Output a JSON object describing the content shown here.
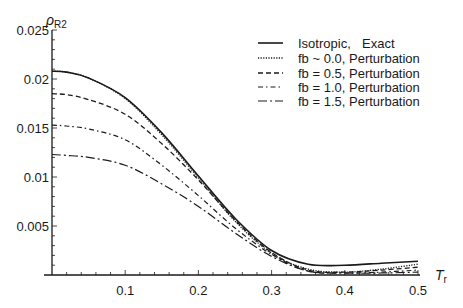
{
  "chart_data": {
    "type": "line",
    "title": "",
    "xlabel": "T",
    "xlabel_sub": "r",
    "ylabel": "ρ",
    "ylabel_sub": "R2",
    "xlim": [
      0,
      0.5
    ],
    "ylim": [
      0,
      0.025
    ],
    "grid": false,
    "legend_position": "upper right",
    "x_ticks": [
      0.1,
      0.2,
      0.3,
      0.4,
      0.5
    ],
    "x_tick_labels": [
      "0.1",
      "0.2",
      "0.3",
      "0.4",
      "0.5"
    ],
    "y_ticks": [
      0.005,
      0.01,
      0.015,
      0.02,
      0.025
    ],
    "y_tick_labels": [
      "0.005",
      "0.01",
      "0.015",
      "0.02",
      "0.025"
    ],
    "x": [
      0.0,
      0.02,
      0.05,
      0.1,
      0.15,
      0.2,
      0.25,
      0.3,
      0.35,
      0.4,
      0.45,
      0.5
    ],
    "series": [
      {
        "name": "Isotropic, Exact",
        "label_a": "Isotropic,",
        "label_b": "Exact",
        "style": "solid",
        "values": [
          0.0208,
          0.0207,
          0.0201,
          0.0181,
          0.0145,
          0.0101,
          0.0058,
          0.0025,
          0.0011,
          0.001,
          0.0012,
          0.0014
        ]
      },
      {
        "name": "fb ~ 0.0, Perturbation",
        "label_a": "fb ~ 0.0,",
        "label_b": "Perturbation",
        "style": "dotted",
        "values": [
          0.0208,
          0.0207,
          0.0201,
          0.018,
          0.0143,
          0.0099,
          0.0055,
          0.0022,
          0.0006,
          0.0003,
          0.0006,
          0.0011
        ]
      },
      {
        "name": "fb = 0.5, Perturbation",
        "label_a": "fb = 0.5,",
        "label_b": "Perturbation",
        "style": "dashed",
        "values": [
          0.0185,
          0.0184,
          0.0179,
          0.0164,
          0.0134,
          0.0097,
          0.0056,
          0.0023,
          0.0005,
          0.0003,
          0.0005,
          0.0008
        ]
      },
      {
        "name": "fb = 1.0, Perturbation",
        "label_a": "fb = 1.0,",
        "label_b": "Perturbation",
        "style": "dashdot",
        "values": [
          0.0153,
          0.0152,
          0.0149,
          0.0138,
          0.0112,
          0.0081,
          0.0048,
          0.0021,
          0.0004,
          0.0002,
          0.0003,
          0.0005
        ]
      },
      {
        "name": "fb = 1.5, Perturbation",
        "label_a": "fb = 1.5,",
        "label_b": "Perturbation",
        "style": "longdashdot",
        "values": [
          0.0123,
          0.0122,
          0.012,
          0.0112,
          0.0093,
          0.007,
          0.0043,
          0.0019,
          0.0004,
          0.0002,
          0.0002,
          0.0003
        ]
      }
    ]
  },
  "colors": {
    "line": "#1a1a1a",
    "background": "#ffffff"
  }
}
